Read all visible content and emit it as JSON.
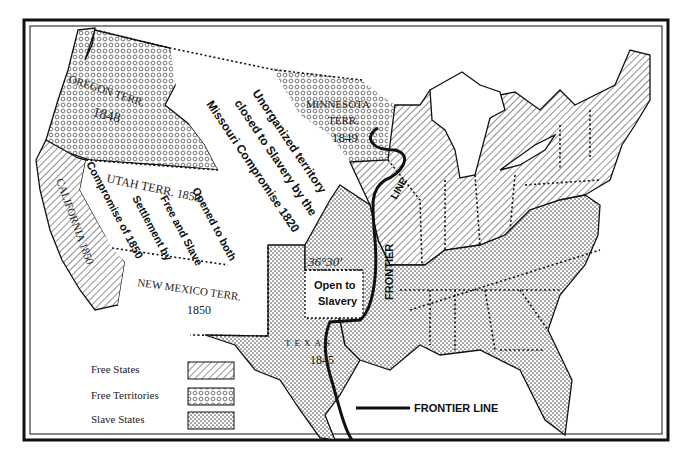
{
  "map": {
    "regions": {
      "oregon": {
        "name": "OREGON TERR.",
        "year": "1848"
      },
      "minnesota": {
        "name": "MINNESOTA",
        "name2": "TERR.",
        "year": "1849"
      },
      "utah": {
        "name": "UTAH TERR. 1850"
      },
      "new_mexico": {
        "name": "NEW MEXICO TERR.",
        "year": "1850"
      },
      "california": {
        "name": "CALIFORNIA 1850"
      },
      "texas": {
        "name": "TEXAS",
        "year": "1845"
      }
    },
    "annotations": {
      "unorganized": [
        "Unorganized territory",
        "closed to Slavery by the",
        "Missouri Compromise 1820"
      ],
      "latitude": "36°30'",
      "open_slavery": [
        "Open to",
        "Slavery"
      ],
      "utah_note": [
        "Opened to both",
        "Free and Slave",
        "Settlement by",
        "Compromise of 1850"
      ],
      "frontier_vertical": "FRONTIER",
      "line_label": "LINE"
    },
    "legend": {
      "items": [
        {
          "label": "Free States",
          "pattern": "hatch"
        },
        {
          "label": "Free Territories",
          "pattern": "circles"
        },
        {
          "label": "Slave States",
          "pattern": "dots"
        }
      ],
      "frontier": "FRONTIER LINE"
    },
    "colors": {
      "ink": "#111111",
      "paper": "#ffffff"
    }
  }
}
